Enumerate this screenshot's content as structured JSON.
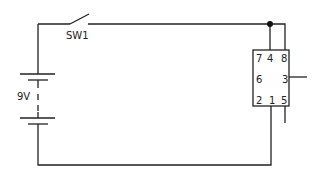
{
  "diagram": {
    "type": "circuit-schematic",
    "switch": {
      "label": "SW1"
    },
    "battery": {
      "label": "9V"
    },
    "ic": {
      "pins": {
        "p7": "7",
        "p4": "4",
        "p8": "8",
        "p6": "6",
        "p3": "3",
        "p2": "2",
        "p1": "1",
        "p5": "5"
      }
    },
    "colors": {
      "wire": "#222222",
      "background": "#ffffff"
    }
  }
}
